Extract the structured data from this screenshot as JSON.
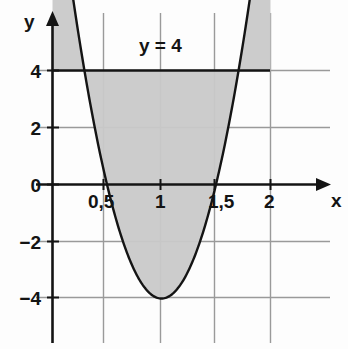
{
  "figure": {
    "title": "",
    "background_color": "#fdfdfd"
  },
  "axes": {
    "x_axis_label": "x",
    "y_axis_label": "y",
    "x_ticks": [
      {
        "value": 0.5,
        "label": "0,5"
      },
      {
        "value": 1.0,
        "label": "1"
      },
      {
        "value": 1.5,
        "label": "1,5"
      },
      {
        "value": 2.0,
        "label": "2"
      }
    ],
    "y_ticks": [
      {
        "value": 4,
        "label": "4"
      },
      {
        "value": 2,
        "label": "2"
      },
      {
        "value": 0,
        "label": "0"
      },
      {
        "value": -2,
        "label": "−2"
      },
      {
        "value": -4,
        "label": "−4"
      }
    ]
  },
  "annotations": {
    "line_label": "y = 4"
  },
  "colors": {
    "axis": "#141414",
    "curve": "#141414",
    "grid": "#9a9a9a",
    "shade_fill": "#c9c9c9",
    "text": "#141414"
  },
  "chart_data": {
    "type": "line",
    "title": "",
    "xlabel": "x",
    "ylabel": "y",
    "xlim": [
      -0.45,
      2.45
    ],
    "ylim": [
      -5.2,
      4.9
    ],
    "grid": true,
    "legend": "none",
    "series": [
      {
        "name": "parabola",
        "equation": "y = 16(x-1)^2 - 4",
        "vertex": [
          1,
          -4
        ],
        "roots": [
          0.5,
          1.5
        ],
        "x": [
          0,
          0.1,
          0.2,
          0.3,
          0.4,
          0.5,
          0.6,
          0.7,
          0.8,
          0.9,
          1.0,
          1.1,
          1.2,
          1.3,
          1.4,
          1.5,
          1.6,
          1.7,
          1.8,
          1.9,
          2.0
        ],
        "y": [
          4,
          1.76,
          0.24,
          -0.84,
          -1.44,
          0,
          -1.44,
          -2.56,
          -3.36,
          -3.84,
          -4,
          -3.84,
          -3.36,
          -2.56,
          -1.44,
          0,
          1.76,
          3.24,
          4,
          4,
          4
        ]
      },
      {
        "name": "horizontal-line-y-equals-4",
        "equation": "y = 4",
        "x": [
          0,
          2
        ],
        "y": [
          4,
          4
        ]
      }
    ],
    "shaded_region": {
      "description": "Region enclosed between the parabola y = 16(x-1)^2 - 4 and the line y = 4",
      "x_from": 0,
      "x_to": 2,
      "upper_bound": "y = 4",
      "lower_bound": "y = 16(x-1)^2 - 4",
      "fill_color": "#c9c9c9"
    },
    "x_tick_values": [
      0.5,
      1,
      1.5,
      2
    ],
    "x_tick_labels": [
      "0,5",
      "1",
      "1,5",
      "2"
    ],
    "y_tick_values": [
      4,
      2,
      0,
      -2,
      -4
    ],
    "y_tick_labels": [
      "4",
      "2",
      "0",
      "−2",
      "−4"
    ],
    "annotations": [
      {
        "text": "y = 4",
        "x": 0.93,
        "y": 4.6
      }
    ]
  }
}
